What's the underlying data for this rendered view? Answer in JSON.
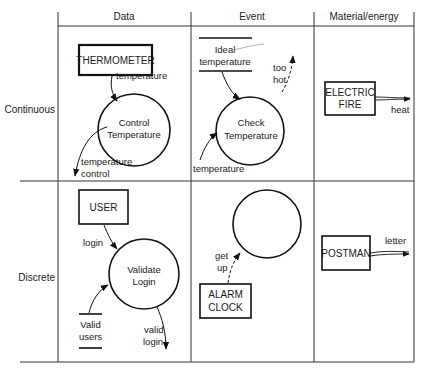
{
  "diagram": {
    "columns": [
      "Data",
      "Event",
      "Material/energy"
    ],
    "rows": [
      "Continuous",
      "Discrete"
    ],
    "continuous": {
      "data": {
        "terminator": "THERMOMETER",
        "input_flow": "temperature",
        "process": [
          "Control",
          "Temperature"
        ],
        "output_flow": [
          "temperature",
          "control"
        ]
      },
      "event": {
        "store": [
          "Ideal",
          "temperature"
        ],
        "process": [
          "Check",
          "Temperature"
        ],
        "output_event": [
          "too",
          "hot"
        ],
        "input_flow": "temperature"
      },
      "material": {
        "terminator": [
          "ELECTRIC",
          "FIRE"
        ],
        "output_flow": "heat"
      }
    },
    "discrete": {
      "data": {
        "terminator": "USER",
        "input_flow": "login",
        "process": [
          "Validate",
          "Login"
        ],
        "store": [
          "Valid",
          "users"
        ],
        "output_flow": [
          "valid",
          "login"
        ]
      },
      "event": {
        "input_event": [
          "get",
          "up"
        ],
        "terminator": [
          "ALARM",
          "CLOCK"
        ]
      },
      "material": {
        "terminator": "POSTMAN",
        "output_flow": "letter"
      }
    }
  }
}
